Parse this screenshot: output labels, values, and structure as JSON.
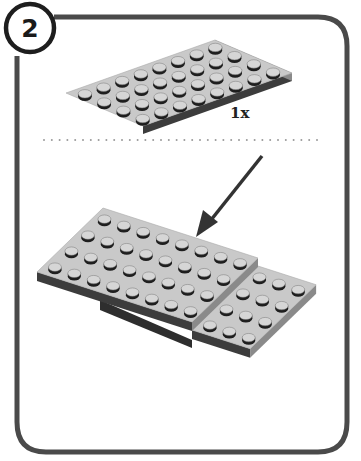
{
  "step": {
    "number": "2"
  },
  "parts_callout": {
    "quantity_label": "1x",
    "part": {
      "name": "plate 4x8",
      "rows": 4,
      "cols": 8,
      "color": "#c8c8c8"
    }
  },
  "assembly": {
    "upper_plate": {
      "rows": 4,
      "cols": 8
    },
    "lower_plate_visible": {
      "rows": 4,
      "cols": 3
    },
    "arrow": "placement-arrow"
  },
  "colors": {
    "frame": "#4a4a4a",
    "plate_top": "#c9c9c9",
    "plate_side_light": "#8a8a8a",
    "plate_side_dark": "#3c3c3c",
    "stud_top": "#d6d6d6",
    "stud_side": "#1e1e1e",
    "divider": "#9a9a9a",
    "arrow": "#333333"
  }
}
